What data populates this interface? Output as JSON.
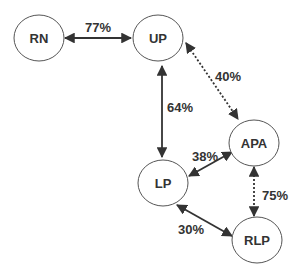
{
  "nodes": [
    {
      "id": "RN",
      "label": "RN"
    },
    {
      "id": "UP",
      "label": "UP"
    },
    {
      "id": "APA",
      "label": "APA"
    },
    {
      "id": "LP",
      "label": "LP"
    },
    {
      "id": "RLP",
      "label": "RLP"
    }
  ],
  "edges": [
    {
      "from": "RN",
      "to": "UP",
      "label": "77%",
      "style": "solid"
    },
    {
      "from": "UP",
      "to": "APA",
      "label": "40%",
      "style": "dotted"
    },
    {
      "from": "UP",
      "to": "LP",
      "label": "64%",
      "style": "solid"
    },
    {
      "from": "LP",
      "to": "APA",
      "label": "38%",
      "style": "solid"
    },
    {
      "from": "APA",
      "to": "RLP",
      "label": "75%",
      "style": "dotted"
    },
    {
      "from": "LP",
      "to": "RLP",
      "label": "30%",
      "style": "solid"
    }
  ]
}
